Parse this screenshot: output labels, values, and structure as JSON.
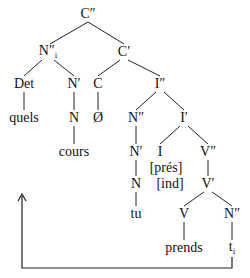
{
  "tree": {
    "nodes": [
      {
        "id": "c2",
        "label": "C″",
        "x": 88,
        "y": 14
      },
      {
        "id": "n2i",
        "label": "N″",
        "sub": "i",
        "x": 48,
        "y": 52
      },
      {
        "id": "c1",
        "label": "C′",
        "x": 124,
        "y": 52
      },
      {
        "id": "det",
        "label": "Det",
        "x": 24,
        "y": 84
      },
      {
        "id": "n1a",
        "label": "N′",
        "x": 74,
        "y": 84
      },
      {
        "id": "c0",
        "label": "C",
        "x": 98,
        "y": 84
      },
      {
        "id": "i2",
        "label": "I″",
        "x": 160,
        "y": 84
      },
      {
        "id": "quels",
        "label": "quels",
        "x": 24,
        "y": 118
      },
      {
        "id": "n0a",
        "label": "N",
        "x": 74,
        "y": 118
      },
      {
        "id": "empty",
        "label": "Ø",
        "x": 98,
        "y": 118
      },
      {
        "id": "n2b",
        "label": "N″",
        "x": 136,
        "y": 118
      },
      {
        "id": "i1",
        "label": "I′",
        "x": 184,
        "y": 118
      },
      {
        "id": "cours",
        "label": "cours",
        "x": 74,
        "y": 152
      },
      {
        "id": "n1b",
        "label": "N′",
        "x": 136,
        "y": 152
      },
      {
        "id": "i0",
        "label": "I",
        "x": 160,
        "y": 152
      },
      {
        "id": "v2",
        "label": "V″",
        "x": 208,
        "y": 152
      },
      {
        "id": "pres",
        "label": "[prés]",
        "x": 166,
        "y": 168
      },
      {
        "id": "n0b",
        "label": "N",
        "x": 136,
        "y": 184
      },
      {
        "id": "ind",
        "label": "[ind]",
        "x": 170,
        "y": 184
      },
      {
        "id": "v1",
        "label": "V′",
        "x": 208,
        "y": 184
      },
      {
        "id": "tu",
        "label": "tu",
        "x": 136,
        "y": 214
      },
      {
        "id": "v0",
        "label": "V",
        "x": 184,
        "y": 214
      },
      {
        "id": "n2c",
        "label": "N″",
        "x": 232,
        "y": 214
      },
      {
        "id": "prends",
        "label": "prends",
        "x": 184,
        "y": 248
      },
      {
        "id": "trace",
        "label": "t",
        "sub": "i",
        "x": 232,
        "y": 248
      }
    ],
    "edges": [
      [
        88,
        22,
        50,
        44
      ],
      [
        88,
        22,
        124,
        44
      ],
      [
        42,
        60,
        24,
        76
      ],
      [
        54,
        60,
        74,
        76
      ],
      [
        120,
        60,
        98,
        76
      ],
      [
        128,
        60,
        160,
        76
      ],
      [
        24,
        92,
        24,
        110
      ],
      [
        74,
        92,
        74,
        110
      ],
      [
        98,
        92,
        98,
        110
      ],
      [
        74,
        126,
        74,
        144
      ],
      [
        156,
        92,
        136,
        110
      ],
      [
        164,
        92,
        184,
        110
      ],
      [
        136,
        126,
        136,
        144
      ],
      [
        180,
        126,
        160,
        144
      ],
      [
        188,
        126,
        208,
        144
      ],
      [
        136,
        160,
        136,
        176
      ],
      [
        208,
        160,
        208,
        176
      ],
      [
        136,
        192,
        136,
        206
      ],
      [
        204,
        192,
        184,
        206
      ],
      [
        212,
        192,
        232,
        206
      ],
      [
        184,
        222,
        184,
        240
      ],
      [
        232,
        222,
        232,
        240
      ]
    ],
    "movement_arrow": {
      "points": "232,257 232,268 22,268 22,196",
      "head": [
        22,
        194
      ]
    }
  }
}
